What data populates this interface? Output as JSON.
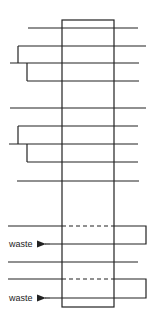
{
  "diagram": {
    "stroke_color": "#222222",
    "box": {
      "x": 62,
      "y": 20,
      "width": 52,
      "height": 287
    },
    "labels": {
      "waste_1": "waste",
      "waste_2": "waste"
    }
  }
}
